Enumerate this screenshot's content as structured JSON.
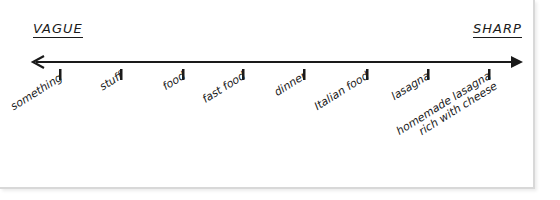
{
  "diagram": {
    "left_label": "VAGUE",
    "right_label": "SHARP",
    "line_color": "#1a1a1a",
    "terms": [
      {
        "label": "something",
        "x": 60
      },
      {
        "label": "stuff",
        "x": 121
      },
      {
        "label": "food",
        "x": 183
      },
      {
        "label": "fast food",
        "x": 243
      },
      {
        "label": "dinner",
        "x": 304
      },
      {
        "label": "Italian food",
        "x": 367
      },
      {
        "label": "lasagna",
        "x": 428
      },
      {
        "label": "homemade lasagna",
        "label_line2": "rich with cheese",
        "x": 489
      }
    ]
  }
}
